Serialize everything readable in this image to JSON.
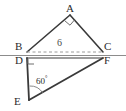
{
  "figure": {
    "type": "plane-geometry",
    "stroke_color": "#3a3a3a",
    "dashed_color": "#9a9a9a",
    "baseline_color": "#8c8c8c",
    "label_color": "#2b2b2b",
    "width": 126,
    "height": 111
  },
  "vertices": {
    "A": {
      "label": "A",
      "x": 70,
      "y": 15
    },
    "B": {
      "label": "B",
      "x": 27,
      "y": 52
    },
    "C": {
      "label": "C",
      "x": 103,
      "y": 52
    },
    "D": {
      "label": "D",
      "x": 27,
      "y": 58
    },
    "E": {
      "label": "E",
      "x": 29,
      "y": 100
    },
    "F": {
      "label": "F",
      "x": 103,
      "y": 58
    }
  },
  "measures": {
    "segment_bc": "6",
    "angle_e": "60",
    "angle_e_degree_symbol": "°",
    "angle_a_mark": "right-angle",
    "angle_d_mark": "right-angle"
  },
  "segments": [
    {
      "name": "AB",
      "from": "B",
      "to": "A",
      "style": "solid"
    },
    {
      "name": "AC",
      "from": "A",
      "to": "C",
      "style": "solid"
    },
    {
      "name": "BC",
      "from": "B",
      "to": "C",
      "style": "dashed"
    },
    {
      "name": "DE",
      "from": "D",
      "to": "E",
      "style": "solid"
    },
    {
      "name": "EF",
      "from": "E",
      "to": "F",
      "style": "solid"
    },
    {
      "name": "DF",
      "from": "D",
      "to": "F",
      "style": "solid"
    },
    {
      "name": "baseline",
      "from": "left-edge",
      "to": "right-edge",
      "style": "solid"
    }
  ]
}
